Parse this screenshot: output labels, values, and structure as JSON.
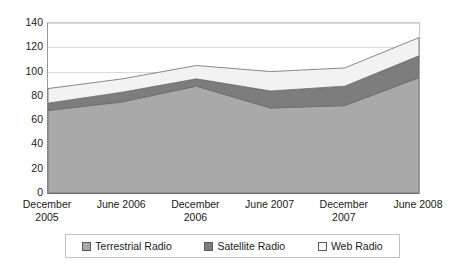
{
  "chart_data": {
    "type": "area",
    "stacked": true,
    "title": "",
    "subtitle": "",
    "xlabel": "",
    "ylabel": "",
    "categories": [
      "December 2005",
      "June 2006",
      "December 2006",
      "June 2007",
      "December 2007",
      "June 2008"
    ],
    "series": [
      {
        "name": "Terrestrial Radio",
        "values": [
          68,
          75,
          88,
          70,
          72,
          95
        ],
        "color": "#a9a9a9"
      },
      {
        "name": "Satellite Radio",
        "values": [
          6,
          8,
          6,
          14,
          16,
          18
        ],
        "color": "#7d7d7d"
      },
      {
        "name": "Web Radio",
        "values": [
          12,
          11,
          11,
          16,
          15,
          15
        ],
        "color": "#f2f2f2"
      }
    ],
    "totals": [
      86,
      94,
      105,
      100,
      103,
      128
    ],
    "ylim": [
      0,
      140
    ],
    "yticks": [
      0,
      20,
      40,
      60,
      80,
      100,
      120,
      140
    ],
    "ytick_labels": [
      "0",
      "20",
      "40",
      "60",
      "80",
      "100",
      "120",
      "140"
    ],
    "grid": true,
    "legend_position": "bottom"
  },
  "xaxis": {
    "labels": [
      {
        "line1": "December",
        "line2": "2005"
      },
      {
        "line1": "June 2006",
        "line2": ""
      },
      {
        "line1": "December",
        "line2": "2006"
      },
      {
        "line1": "June 2007",
        "line2": ""
      },
      {
        "line1": "December",
        "line2": "2007"
      },
      {
        "line1": "June 2008",
        "line2": ""
      }
    ]
  },
  "legend": {
    "items": [
      {
        "label": "Terrestrial Radio",
        "color": "#a9a9a9"
      },
      {
        "label": "Satellite Radio",
        "color": "#7d7d7d"
      },
      {
        "label": "Web Radio",
        "color": "#ffffff"
      }
    ]
  }
}
